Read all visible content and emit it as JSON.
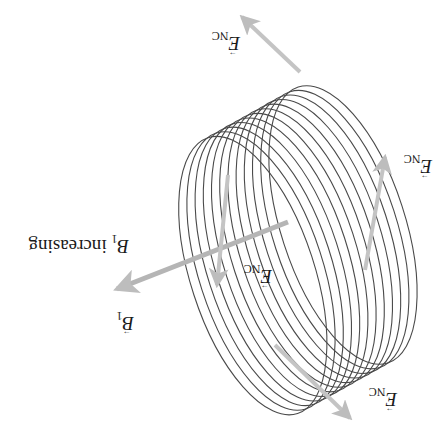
{
  "figure": {
    "orientation": "rotated 180 degrees",
    "coil": {
      "loop_count": 12,
      "stroke_color": "#4a4a4a"
    },
    "arrow_color": "#bdbdbd",
    "labels": {
      "b_field": {
        "symbol": "B",
        "subscript": "1"
      },
      "b_increasing": {
        "symbol": "B",
        "subscript": "1",
        "text": " increasing"
      },
      "e_top": {
        "symbol": "E",
        "subscript": "NC"
      },
      "e_right": {
        "symbol": "E",
        "subscript": "NC"
      },
      "e_center": {
        "symbol": "E",
        "subscript": "NC"
      },
      "e_bottom": {
        "symbol": "E",
        "subscript": "NC"
      }
    }
  }
}
